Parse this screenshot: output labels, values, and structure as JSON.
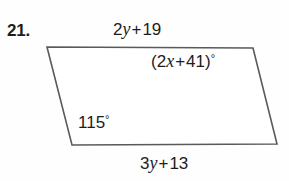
{
  "problem": {
    "number": "21."
  },
  "figure": {
    "shape_name": "parallelogram",
    "stroke_color": "#5a5a5a",
    "fill_color": "#ffffff",
    "stroke_width": 1.6,
    "vertices": {
      "top_left": [
        47,
        47
      ],
      "top_right": [
        253,
        48
      ],
      "bottom_right": [
        277,
        144
      ],
      "bottom_left": [
        72,
        145
      ]
    }
  },
  "labels": {
    "top_side": {
      "text": "2y + 19",
      "coefficient": "2",
      "variable": "y",
      "operator": "+",
      "constant": "19"
    },
    "bottom_side": {
      "text": "3y + 13",
      "coefficient": "3",
      "variable": "y",
      "operator": "+",
      "constant": "13"
    },
    "angle_top_right": {
      "text": "(2x + 41)°",
      "open_paren": "(",
      "coefficient": "2",
      "variable": "x",
      "operator": "+",
      "constant": "41",
      "close_paren": ")",
      "degree": "°"
    },
    "angle_bottom_left": {
      "text": "115°",
      "value": "115",
      "degree": "°"
    }
  }
}
